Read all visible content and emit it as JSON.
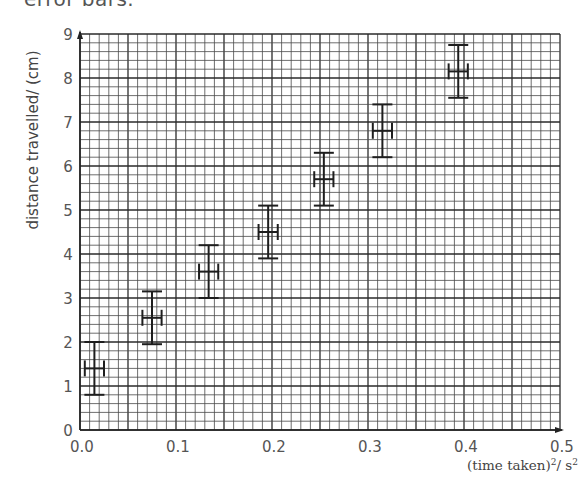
{
  "header": {
    "clipped_text": "error bars."
  },
  "chart_data": {
    "type": "scatter",
    "title": "",
    "xlabel": "(time taken)²/ s²",
    "xlabel_parts": {
      "base": "(time taken)",
      "sup1": "2",
      "mid": "/ s",
      "sup2": "2"
    },
    "ylabel": "distance travelled/ (cm)",
    "xlim": [
      0.0,
      0.5
    ],
    "ylim": [
      0,
      9
    ],
    "x_ticks": [
      "0.0",
      "0.1",
      "0.2",
      "0.3",
      "0.4",
      "0.5"
    ],
    "y_ticks": [
      "0",
      "1",
      "2",
      "3",
      "4",
      "5",
      "6",
      "7",
      "8",
      "9"
    ],
    "grid": {
      "on": true,
      "minor_x_step": 0.01,
      "minor_y_step": 0.2,
      "major_every": 5
    },
    "legend": null,
    "series": [
      {
        "name": "measurements",
        "marker": "cross with error bars",
        "points": [
          {
            "x": 0.015,
            "y": 1.4,
            "x_err": 0.01,
            "y_err": 0.6
          },
          {
            "x": 0.075,
            "y": 2.55,
            "x_err": 0.01,
            "y_err": 0.6
          },
          {
            "x": 0.134,
            "y": 3.6,
            "x_err": 0.01,
            "y_err": 0.6
          },
          {
            "x": 0.196,
            "y": 4.5,
            "x_err": 0.01,
            "y_err": 0.6
          },
          {
            "x": 0.254,
            "y": 5.7,
            "x_err": 0.01,
            "y_err": 0.6
          },
          {
            "x": 0.315,
            "y": 6.8,
            "x_err": 0.01,
            "y_err": 0.6
          },
          {
            "x": 0.394,
            "y": 8.15,
            "x_err": 0.01,
            "y_err": 0.6
          }
        ]
      }
    ]
  },
  "colors": {
    "grid_minor": "#4a4a4a",
    "grid_major": "#2a2a2a",
    "axis": "#222222",
    "error_bar": "#1e1e1e"
  }
}
